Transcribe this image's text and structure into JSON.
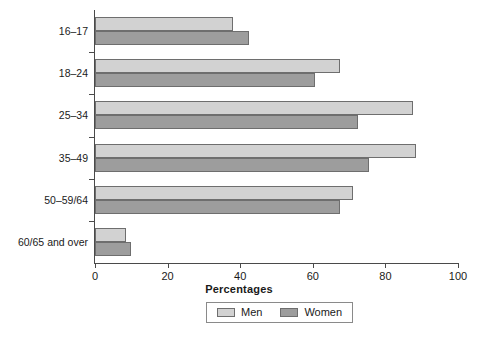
{
  "chart_data": {
    "type": "bar",
    "orientation": "horizontal",
    "title": "",
    "xlabel": "Percentages",
    "ylabel": "",
    "xlim": [
      0,
      100
    ],
    "xticks": [
      0,
      20,
      40,
      60,
      80,
      100
    ],
    "xticklabels": [
      "0",
      "20",
      "40",
      "60",
      "80",
      "100"
    ],
    "grid": false,
    "legend_position": "bottom-center",
    "categories": [
      "16–17",
      "18–24",
      "25–34",
      "35–49",
      "50–59/64",
      "60/65 and over"
    ],
    "series": [
      {
        "name": "Men",
        "color": "#d2d2d2",
        "values": [
          38,
          67.5,
          87.5,
          88.5,
          71,
          8.5
        ]
      },
      {
        "name": "Women",
        "color": "#9d9d9d",
        "values": [
          42.5,
          60.5,
          72.5,
          75.5,
          67.5,
          10
        ]
      }
    ]
  },
  "legend": {
    "items": [
      {
        "label": "Men"
      },
      {
        "label": "Women"
      }
    ]
  },
  "axis": {
    "x_title": "Percentages"
  }
}
